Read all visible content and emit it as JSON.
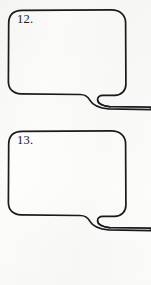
{
  "page": {
    "kind": "worksheet-scan",
    "background_color": "#fcfcfb",
    "ink_color": "#1a1a1c",
    "width": 151,
    "height": 285
  },
  "balloons": [
    {
      "number_label": "12.",
      "body": {
        "x": 8,
        "y": 10,
        "width": 118,
        "height": 86,
        "corner_radius": 13
      },
      "tail": {
        "direction": "down-right",
        "exits_image_edge": true,
        "exit_y": 107
      },
      "content_text": "",
      "filled": false
    },
    {
      "number_label": "13.",
      "body": {
        "x": 8,
        "y": 131,
        "width": 118,
        "height": 86,
        "corner_radius": 13
      },
      "tail": {
        "direction": "down-right",
        "exits_image_edge": true,
        "exit_y": 228
      },
      "content_text": "",
      "filled": false
    }
  ]
}
